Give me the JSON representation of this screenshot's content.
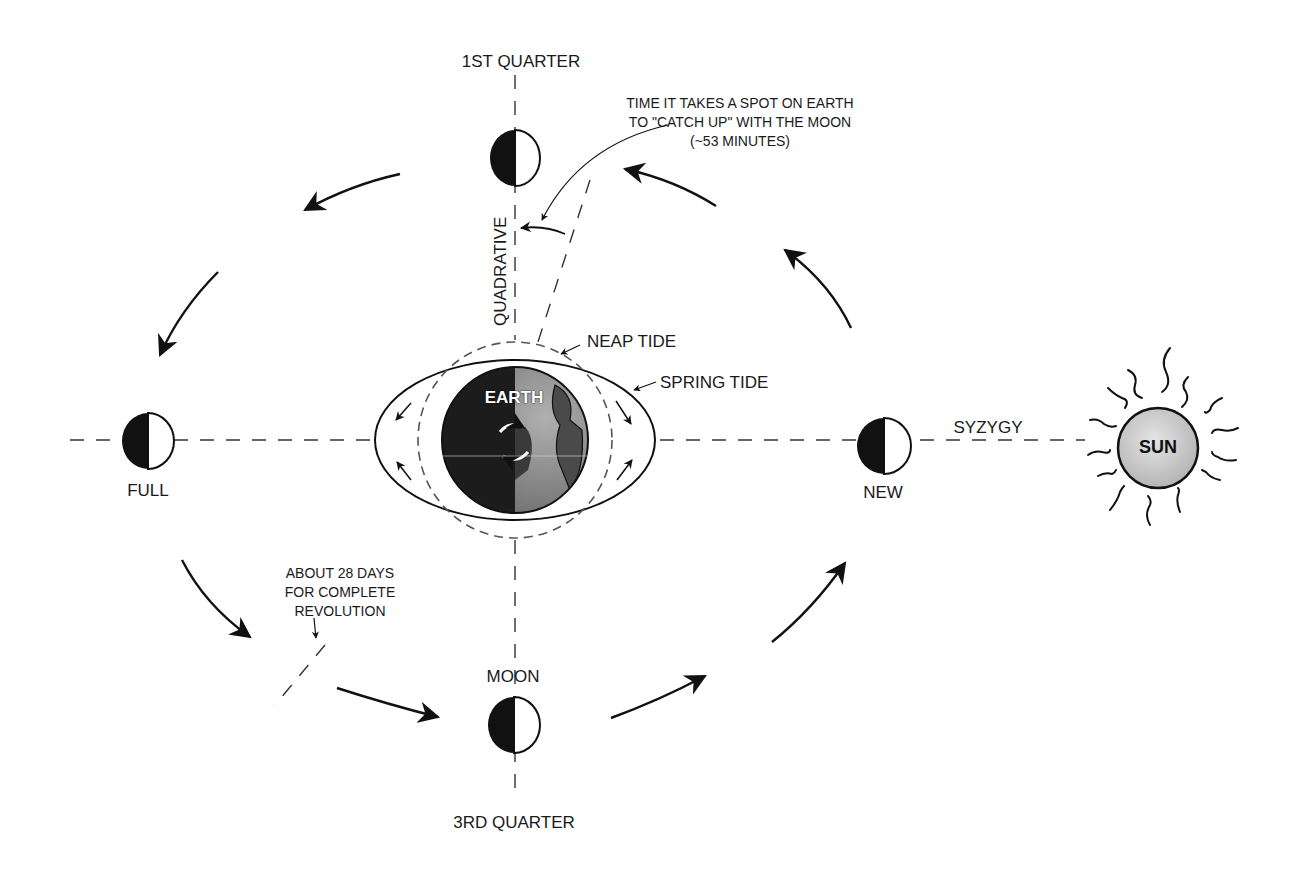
{
  "diagram": {
    "labels": {
      "first_quarter": "1ST QUARTER",
      "third_quarter": "3RD QUARTER",
      "moon": "MOON",
      "full": "FULL",
      "new": "NEW",
      "earth": "EARTH",
      "sun": "SUN",
      "syzygy": "SYZYGY",
      "quadrative": "QUADRATIVE",
      "neap_tide": "NEAP TIDE",
      "spring_tide": "SPRING TIDE"
    },
    "annotations": {
      "catch_up_line1": "TIME IT TAKES A SPOT ON EARTH",
      "catch_up_line2": "TO \"CATCH UP\" WITH THE MOON",
      "catch_up_line3": "(~53 MINUTES)",
      "revolution_line1": "ABOUT 28 DAYS",
      "revolution_line2": "FOR COMPLETE",
      "revolution_line3": "REVOLUTION"
    },
    "colors": {
      "ink": "#111111",
      "earth_dark": "#1c1c1c",
      "earth_light": "#8a8a8a",
      "sun_fill": "#c8c8c8",
      "background": "#ffffff"
    }
  }
}
